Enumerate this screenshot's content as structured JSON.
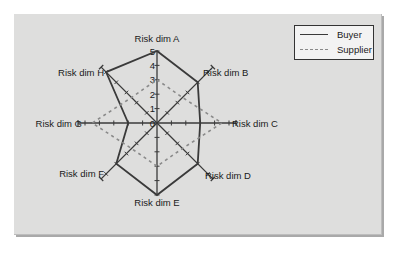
{
  "chart_data": {
    "type": "radar",
    "title": "",
    "categories": [
      "Risk dim A",
      "Risk dim B",
      "Risk dim C",
      "Risk dim D",
      "Risk dim E",
      "Risk dim F",
      "Risk dim G",
      "Risk dim H"
    ],
    "series": [
      {
        "name": "Buyer",
        "style": "solid",
        "color": "#3a3a3a",
        "values": [
          5,
          4,
          3,
          4,
          5,
          4,
          2,
          5
        ]
      },
      {
        "name": "Supplier",
        "style": "dashed",
        "color": "#8a8a8a",
        "values": [
          3,
          2.5,
          4.5,
          2.5,
          3,
          2.5,
          4.5,
          2.5
        ]
      }
    ],
    "radial_ticks": [
      0,
      1,
      2,
      3,
      4,
      5
    ],
    "rlim": [
      0,
      5
    ],
    "grid": false,
    "legend_position": "top-right"
  },
  "legend": {
    "items": [
      {
        "label": "Buyer"
      },
      {
        "label": "Supplier"
      }
    ]
  },
  "colors": {
    "panel_background": "#dededd",
    "axis": "#3a3a3a"
  }
}
